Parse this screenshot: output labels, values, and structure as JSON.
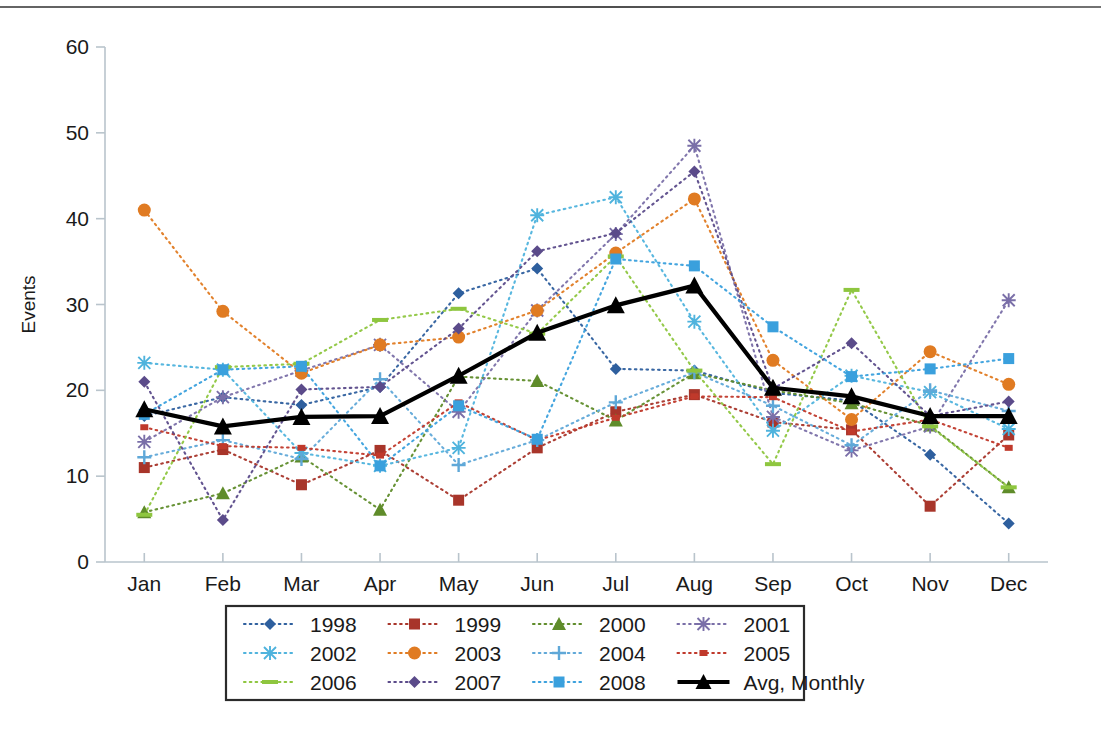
{
  "chart_data": {
    "type": "line",
    "title": "",
    "xlabel": "",
    "ylabel": "Events",
    "categories": [
      "Jan",
      "Feb",
      "Mar",
      "Apr",
      "May",
      "Jun",
      "Jul",
      "Aug",
      "Sep",
      "Oct",
      "Nov",
      "Dec"
    ],
    "ylim": [
      0,
      60
    ],
    "yticks": [
      0,
      10,
      20,
      30,
      40,
      50,
      60
    ],
    "grid": false,
    "legend_position": "bottom",
    "legend_columns": 4,
    "series": [
      {
        "name": "1998",
        "color": "#2e5f9e",
        "marker": "diamond",
        "dash": "dotted",
        "values": [
          17.0,
          19.2,
          18.3,
          20.4,
          31.3,
          34.2,
          22.5,
          22.3,
          19.7,
          18.8,
          12.5,
          4.5
        ]
      },
      {
        "name": "1999",
        "color": "#a8352a",
        "marker": "square",
        "dash": "dotted",
        "values": [
          11.0,
          13.1,
          9.0,
          13.0,
          7.2,
          13.3,
          17.5,
          19.5,
          16.3,
          15.4,
          6.5,
          14.8
        ]
      },
      {
        "name": "2000",
        "color": "#5f8c2a",
        "marker": "triangle",
        "dash": "dotted",
        "values": [
          5.8,
          8.0,
          12.3,
          6.1,
          21.6,
          21.1,
          16.5,
          22.0,
          20.0,
          18.5,
          15.9,
          8.7
        ]
      },
      {
        "name": "2001",
        "color": "#7a6fa8",
        "marker": "star",
        "dash": "dotted",
        "values": [
          14.0,
          19.2,
          22.3,
          25.3,
          17.5,
          29.3,
          38.2,
          48.5,
          16.9,
          13.0,
          15.8,
          30.5
        ]
      },
      {
        "name": "2002",
        "color": "#4fb3dd",
        "marker": "star",
        "dash": "dotted",
        "values": [
          23.2,
          22.4,
          12.7,
          11.2,
          13.3,
          40.4,
          42.5,
          28.0,
          15.3,
          21.7,
          19.8,
          15.5
        ]
      },
      {
        "name": "2003",
        "color": "#e07b22",
        "marker": "circle",
        "dash": "dotted",
        "values": [
          41.0,
          29.2,
          22.0,
          25.3,
          26.2,
          29.3,
          36.0,
          42.3,
          23.5,
          16.6,
          24.5,
          20.7
        ]
      },
      {
        "name": "2004",
        "color": "#5fa8d8",
        "marker": "plus",
        "dash": "dotted",
        "values": [
          12.2,
          14.2,
          12.0,
          21.3,
          11.3,
          14.2,
          18.6,
          22.1,
          18.2,
          13.6,
          20.0,
          17.6
        ]
      },
      {
        "name": "2005",
        "color": "#c0392b",
        "marker": "smallsquare",
        "dash": "dotted",
        "values": [
          15.7,
          13.5,
          13.3,
          12.4,
          18.6,
          14.2,
          16.8,
          19.3,
          19.2,
          15.2,
          16.6,
          13.3
        ]
      },
      {
        "name": "2006",
        "color": "#8ec63f",
        "marker": "dash",
        "dash": "dotted",
        "values": [
          5.5,
          22.7,
          23.1,
          28.2,
          29.5,
          26.6,
          35.6,
          22.3,
          11.4,
          31.7,
          15.8,
          8.7
        ]
      },
      {
        "name": "2007",
        "color": "#5b4b8a",
        "marker": "diamond",
        "dash": "dotted",
        "values": [
          21.0,
          4.9,
          20.1,
          20.4,
          27.2,
          36.2,
          38.3,
          45.5,
          20.2,
          25.5,
          17.0,
          18.7
        ]
      },
      {
        "name": "2008",
        "color": "#3aa0dd",
        "marker": "square",
        "dash": "dotted",
        "values": [
          17.2,
          22.4,
          22.8,
          11.2,
          18.2,
          14.3,
          35.3,
          34.5,
          27.4,
          21.6,
          22.5,
          23.7
        ]
      }
    ],
    "highlight_series": {
      "name": "Avg, Monthly",
      "color": "#000000",
      "marker": "triangle",
      "dash": "solid",
      "values": [
        17.8,
        15.8,
        16.9,
        17.0,
        21.7,
        26.7,
        29.9,
        32.2,
        20.3,
        19.3,
        17.0,
        17.0
      ]
    }
  },
  "legend": {
    "entries": [
      "1998",
      "1999",
      "2000",
      "2001",
      "2002",
      "2003",
      "2004",
      "2005",
      "2006",
      "2007",
      "2008",
      "Avg, Monthly"
    ]
  },
  "axes": {
    "y_title": "Events",
    "y_tick_labels": [
      "0",
      "10",
      "20",
      "30",
      "40",
      "50",
      "60"
    ],
    "x_tick_labels": [
      "Jan",
      "Feb",
      "Mar",
      "Apr",
      "May",
      "Jun",
      "Jul",
      "Aug",
      "Sep",
      "Oct",
      "Nov",
      "Dec"
    ]
  },
  "colors": {
    "axis": "#b9c4cc",
    "text": "#1a1a1a",
    "legend_border": "#2b2b2b",
    "background": "#ffffff"
  }
}
